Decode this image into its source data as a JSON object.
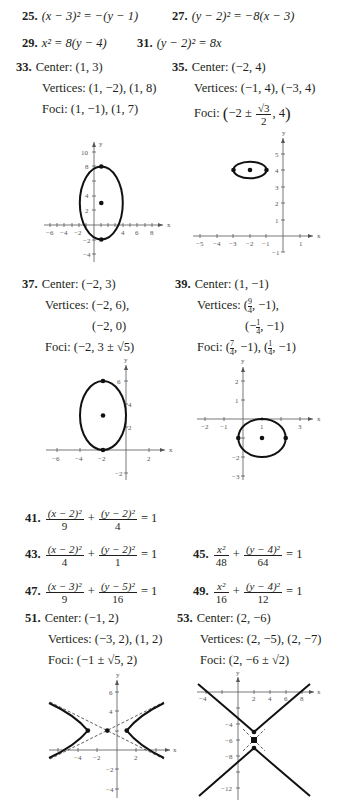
{
  "answers": {
    "a25": {
      "num": "25.",
      "eq": "(x − 3)² = −(y − 1)"
    },
    "a27": {
      "num": "27.",
      "eq": "(y − 2)² = −8(x − 3)"
    },
    "a29": {
      "num": "29.",
      "eq": "x² = 8(y − 4)"
    },
    "a31": {
      "num": "31.",
      "eq": "(y − 2)² = 8x"
    },
    "a33": {
      "num": "33.",
      "center": "Center: (1, 3)",
      "vertices": "Vertices: (1, −2), (1, 8)",
      "foci": "Foci: (1, −1), (1, 7)"
    },
    "a35": {
      "num": "35.",
      "center": "Center: (−2, 4)",
      "vertices": "Vertices: (−1, 4), (−3, 4)",
      "foci_label": "Foci:",
      "foci_pre": "−2 ±",
      "foci_num": "√3",
      "foci_den": "2",
      "foci_post": ", 4"
    },
    "a37": {
      "num": "37.",
      "center": "Center: (−2, 3)",
      "vertices1": "Vertices: (−2, 6),",
      "vertices2": "(−2, 0)",
      "foci": "Foci: (−2, 3 ± √5)"
    },
    "a39": {
      "num": "39.",
      "center": "Center: (1, −1)",
      "vertices_label": "Vertices:",
      "v1_num": "9",
      "v1_den": "4",
      "v1_post": ", −1),",
      "v2_pre": "(−",
      "v2_num": "1",
      "v2_den": "4",
      "v2_post": ", −1)",
      "foci_label": "Foci:",
      "f1_num": "7",
      "f1_den": "4",
      "f1_post": ", −1), (",
      "f2_num": "1",
      "f2_den": "4",
      "f2_post": ", −1)"
    },
    "a41": {
      "num": "41.",
      "t1n": "(x − 2)²",
      "t1d": "9",
      "t2n": "(y − 2)²",
      "t2d": "4",
      "rhs": "= 1"
    },
    "a43": {
      "num": "43.",
      "t1n": "(x − 2)²",
      "t1d": "4",
      "t2n": "(y − 2)²",
      "t2d": "1",
      "rhs": "= 1"
    },
    "a45": {
      "num": "45.",
      "t1n": "x²",
      "t1d": "48",
      "t2n": "(y − 4)²",
      "t2d": "64",
      "rhs": "= 1"
    },
    "a47": {
      "num": "47.",
      "t1n": "(x − 3)²",
      "t1d": "9",
      "t2n": "(y − 5)²",
      "t2d": "16",
      "rhs": "= 1"
    },
    "a49": {
      "num": "49.",
      "t1n": "x²",
      "t1d": "16",
      "t2n": "(y − 4)²",
      "t2d": "12",
      "rhs": "= 1"
    },
    "a51": {
      "num": "51.",
      "center": "Center: (−1, 2)",
      "vertices": "Vertices: (−3, 2), (1, 2)",
      "foci": "Foci: (−1 ± √5, 2)"
    },
    "a53": {
      "num": "53.",
      "center": "Center: (2, −6)",
      "vertices": "Vertices: (2, −5), (2, −7)",
      "foci": "Foci: (2, −6 ± √2)"
    }
  },
  "graphs": {
    "g33": {
      "xlabel": "x",
      "ylabel": "y",
      "xticks": [
        "−6",
        "−4",
        "−2",
        "4",
        "6",
        "8"
      ],
      "yticks": [
        "10",
        "8",
        "4",
        "2",
        "−2",
        "−4"
      ]
    },
    "g35": {
      "xlabel": "x",
      "ylabel": "y",
      "xticks": [
        "−5",
        "−4",
        "−3",
        "−2",
        "−1",
        "1"
      ],
      "yticks": [
        "5",
        "4",
        "3",
        "2",
        "1",
        "−1"
      ]
    },
    "g37": {
      "xlabel": "x",
      "ylabel": "y",
      "xticks": [
        "−6",
        "−4",
        "−2",
        "2"
      ],
      "yticks": [
        "6",
        "4",
        "2",
        "−2"
      ]
    },
    "g39": {
      "xlabel": "x",
      "ylabel": "y",
      "xticks": [
        "−2",
        "−1",
        "1",
        "3"
      ],
      "yticks": [
        "2",
        "1",
        "−2",
        "−3"
      ]
    },
    "g51": {
      "xlabel": "x",
      "ylabel": "y",
      "xticks": [
        "−4",
        "−2",
        "2"
      ],
      "yticks": [
        "6",
        "4",
        "−2",
        "−4"
      ]
    },
    "g53": {
      "xlabel": "x",
      "ylabel": "y",
      "xticks": [
        "−4",
        "2",
        "4",
        "6",
        "8"
      ],
      "yticks": [
        "−4",
        "−6",
        "−8",
        "−12"
      ]
    }
  }
}
